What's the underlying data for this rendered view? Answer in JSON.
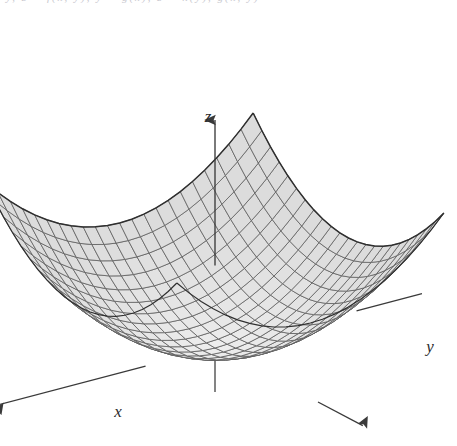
{
  "figure": {
    "background_color": "#ffffff",
    "clipped_header_text": "y, z = f(x, y), y = g(x), z = h(y), g(x, y)",
    "surface_fill_color": "#e9e9e9",
    "surface_line_color": "#5a5a5a",
    "surface_edge_color": "#2f2f2f",
    "axis_color": "#3a3a3a"
  },
  "axes": {
    "x": {
      "label": "x",
      "label_x": 118,
      "label_y": 417,
      "arrow": "down-left"
    },
    "y": {
      "label": "y",
      "label_x": 430,
      "label_y": 352,
      "arrow": "right"
    },
    "z": {
      "label": "z",
      "label_x": 208,
      "label_y": 122,
      "arrow": "up"
    }
  },
  "chart_data": {
    "type": "surface",
    "title": "",
    "subtitle": "",
    "equation": "z = x^2 + y^2",
    "surface_name": "elliptic-paraboloid",
    "xlabel": "x",
    "ylabel": "y",
    "zlabel": "z",
    "xlim": [
      -1,
      1
    ],
    "ylim": [
      -1,
      1
    ],
    "zlim": [
      0,
      2
    ],
    "grid": true,
    "grid_divisions_u": 22,
    "grid_divisions_v": 22,
    "legend": false,
    "wireframe": true,
    "shaded": true,
    "projection": {
      "azimuth_deg": 35,
      "elevation_deg": 22,
      "origin_px": [
        215,
        348
      ],
      "scale_px": 163,
      "z_scale_px": 150
    },
    "annotations": []
  }
}
